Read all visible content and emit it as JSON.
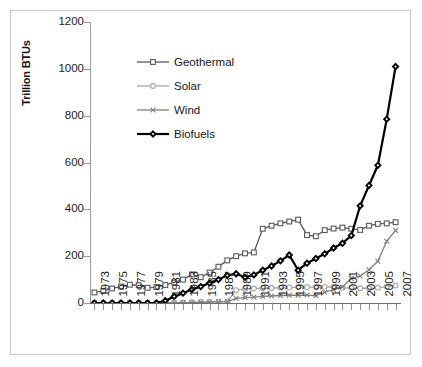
{
  "chart_data": {
    "type": "line",
    "title": "",
    "xlabel": "",
    "ylabel": "Trillion BTUs",
    "ylim": [
      0,
      1200
    ],
    "yticks": [
      0,
      200,
      400,
      600,
      800,
      1000,
      1200
    ],
    "xlim": [
      1973,
      2007
    ],
    "grid": false,
    "legend_position": "upper-left-inside",
    "x": [
      1973,
      1974,
      1975,
      1976,
      1977,
      1978,
      1979,
      1980,
      1981,
      1982,
      1983,
      1984,
      1985,
      1986,
      1987,
      1988,
      1989,
      1990,
      1991,
      1992,
      1993,
      1994,
      1995,
      1996,
      1997,
      1998,
      1999,
      2000,
      2001,
      2002,
      2003,
      2004,
      2005,
      2006,
      2007
    ],
    "xtick_labels": [
      "1973",
      "1975",
      "1977",
      "1979",
      "1981",
      "1983",
      "1985",
      "1987",
      "1989",
      "1991",
      "1993",
      "1995",
      "1997",
      "1999",
      "2001",
      "2003",
      "2005",
      "2007"
    ],
    "series": [
      {
        "name": "Geothermal",
        "color": "#595959",
        "marker": "square",
        "values": [
          45,
          52,
          62,
          70,
          78,
          76,
          65,
          68,
          77,
          88,
          100,
          122,
          110,
          130,
          155,
          182,
          200,
          212,
          216,
          317,
          330,
          340,
          348,
          356,
          290,
          285,
          311,
          318,
          322,
          317,
          312,
          330,
          338,
          340,
          345
        ]
      },
      {
        "name": "Solar",
        "color": "#a6a6a6",
        "marker": "circle",
        "values": [
          0,
          0,
          0,
          0,
          0,
          0,
          0,
          0,
          0,
          0,
          2,
          3,
          4,
          5,
          6,
          7,
          55,
          60,
          62,
          63,
          64,
          65,
          66,
          68,
          68,
          68,
          69,
          68,
          65,
          64,
          63,
          63,
          65,
          70,
          75
        ]
      },
      {
        "name": "Wind",
        "color": "#7f7f7f",
        "marker": "x",
        "values": [
          0,
          0,
          0,
          0,
          0,
          0,
          0,
          0,
          0,
          0,
          1,
          2,
          3,
          4,
          5,
          6,
          20,
          23,
          25,
          28,
          30,
          32,
          33,
          33,
          34,
          31,
          46,
          57,
          68,
          105,
          115,
          142,
          178,
          264,
          310
        ]
      },
      {
        "name": "Biofuels",
        "color": "#000000",
        "marker": "diamond",
        "values": [
          0,
          0,
          0,
          0,
          0,
          0,
          0,
          0,
          10,
          28,
          42,
          58,
          70,
          85,
          100,
          118,
          125,
          110,
          120,
          140,
          158,
          180,
          205,
          140,
          170,
          190,
          210,
          235,
          255,
          288,
          415,
          502,
          588,
          785,
          1010
        ]
      }
    ]
  },
  "legend": {
    "items": [
      {
        "label": "Geothermal"
      },
      {
        "label": "Solar"
      },
      {
        "label": "Wind"
      },
      {
        "label": "Biofuels"
      }
    ]
  },
  "axes": {
    "y_title": "Trillion BTUs"
  }
}
